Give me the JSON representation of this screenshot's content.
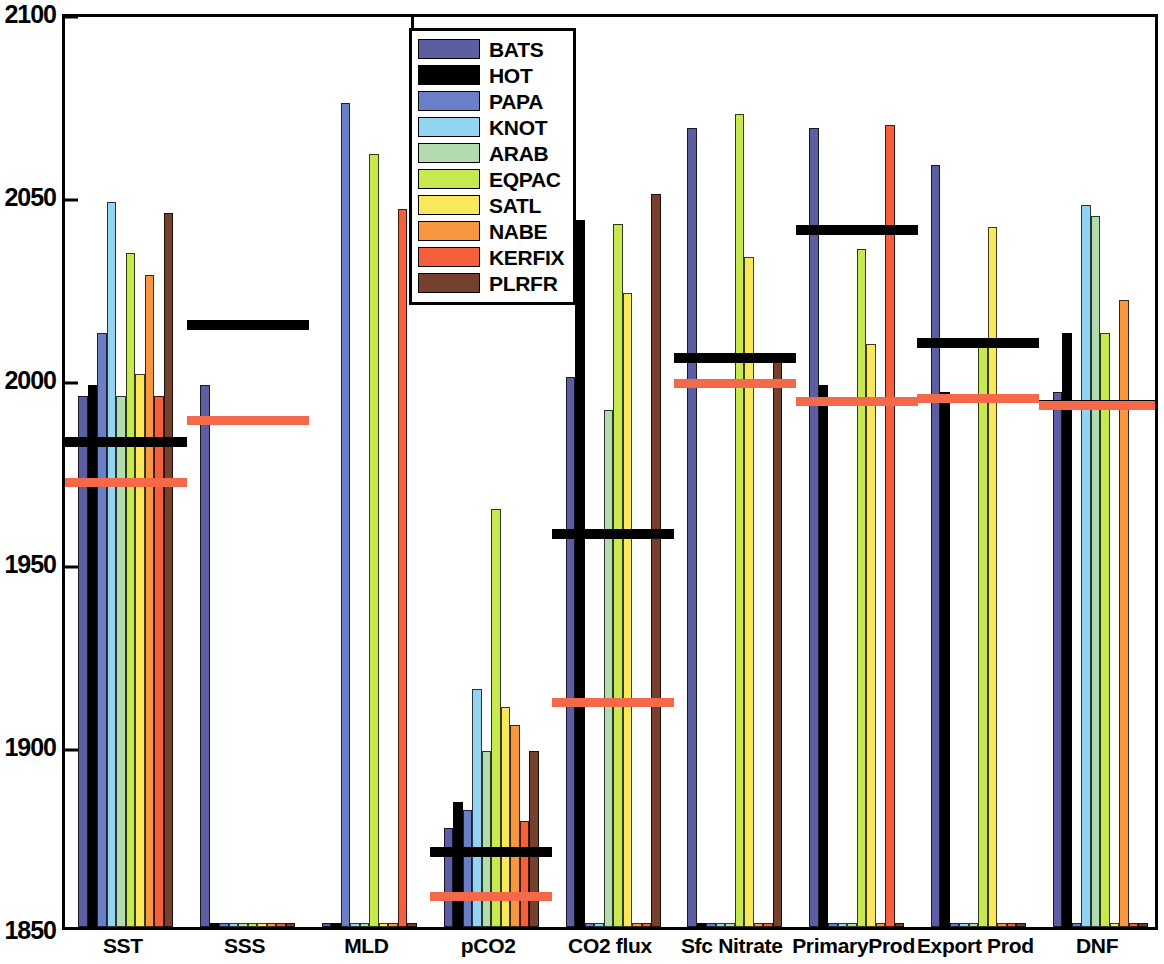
{
  "chart_data": {
    "type": "bar",
    "title": "",
    "xlabel": "",
    "ylabel": "",
    "ylim": [
      1850,
      2100
    ],
    "yticks": [
      1850,
      1900,
      1950,
      2000,
      2050,
      2100
    ],
    "ytick_labels": [
      "1850",
      "1900",
      "1950",
      "2000",
      "2050",
      "2100"
    ],
    "grid": false,
    "legend_position": "top-center",
    "categories": [
      "SST",
      "SSS",
      "MLD",
      "pCO2",
      "CO2 flux",
      "Sfc Nitrate",
      "PrimaryProd",
      "Export Prod",
      "DNF"
    ],
    "series": [
      {
        "name": "BATS",
        "color": "#5b5ea0",
        "values": [
          1995,
          1998,
          1851,
          1877,
          2000,
          2068,
          2068,
          2058,
          1996
        ]
      },
      {
        "name": "HOT",
        "color": "#000000",
        "values": [
          1998,
          1851,
          1851,
          1884,
          2043,
          1851,
          1998,
          1996,
          2012
        ]
      },
      {
        "name": "PAPA",
        "color": "#6b7fc7",
        "values": [
          2012,
          1851,
          2075,
          1882,
          1851,
          1851,
          1851,
          1851,
          1851
        ]
      },
      {
        "name": "KNOT",
        "color": "#93d4f0",
        "values": [
          2048,
          1851,
          1851,
          1915,
          1851,
          1851,
          1851,
          1851,
          2047
        ]
      },
      {
        "name": "ARAB",
        "color": "#b2dcae",
        "values": [
          1995,
          1851,
          1851,
          1898,
          1991,
          1851,
          1851,
          1851,
          2044
        ]
      },
      {
        "name": "EQPAC",
        "color": "#c8e84f",
        "values": [
          2034,
          1851,
          2061,
          1964,
          2042,
          2072,
          2035,
          2010,
          2012
        ]
      },
      {
        "name": "SATL",
        "color": "#f9e85c",
        "values": [
          2001,
          1851,
          1851,
          1910,
          2023,
          2033,
          2009,
          2041,
          1851
        ]
      },
      {
        "name": "NABE",
        "color": "#f79840",
        "values": [
          2028,
          1851,
          1851,
          1905,
          1851,
          1851,
          1851,
          1851,
          2021
        ]
      },
      {
        "name": "KERFIX",
        "color": "#f4603c",
        "values": [
          1995,
          1851,
          2046,
          1879,
          1851,
          1851,
          2069,
          1851,
          1851
        ]
      },
      {
        "name": "PLRFR",
        "color": "#76412c",
        "values": [
          2045,
          1851,
          1851,
          1898,
          2050,
          2006,
          1851,
          1851,
          1851
        ]
      }
    ],
    "reference_lines": [
      {
        "name": "black-reference-line",
        "color": "#000000",
        "values": [
          1984,
          2016,
          null,
          1872,
          1959,
          2007,
          2042,
          2011,
          1994
        ]
      },
      {
        "name": "orange-reference-line",
        "color": "#f4694a",
        "values": [
          1973,
          1990,
          null,
          1860,
          1913,
          2000,
          1995,
          1996,
          1994
        ]
      }
    ]
  },
  "legend": {
    "entries": [
      {
        "label": "BATS"
      },
      {
        "label": "HOT"
      },
      {
        "label": "PAPA"
      },
      {
        "label": "KNOT"
      },
      {
        "label": "ARAB"
      },
      {
        "label": "EQPAC"
      },
      {
        "label": "SATL"
      },
      {
        "label": "NABE"
      },
      {
        "label": "KERFIX"
      },
      {
        "label": "PLRFR"
      }
    ]
  }
}
